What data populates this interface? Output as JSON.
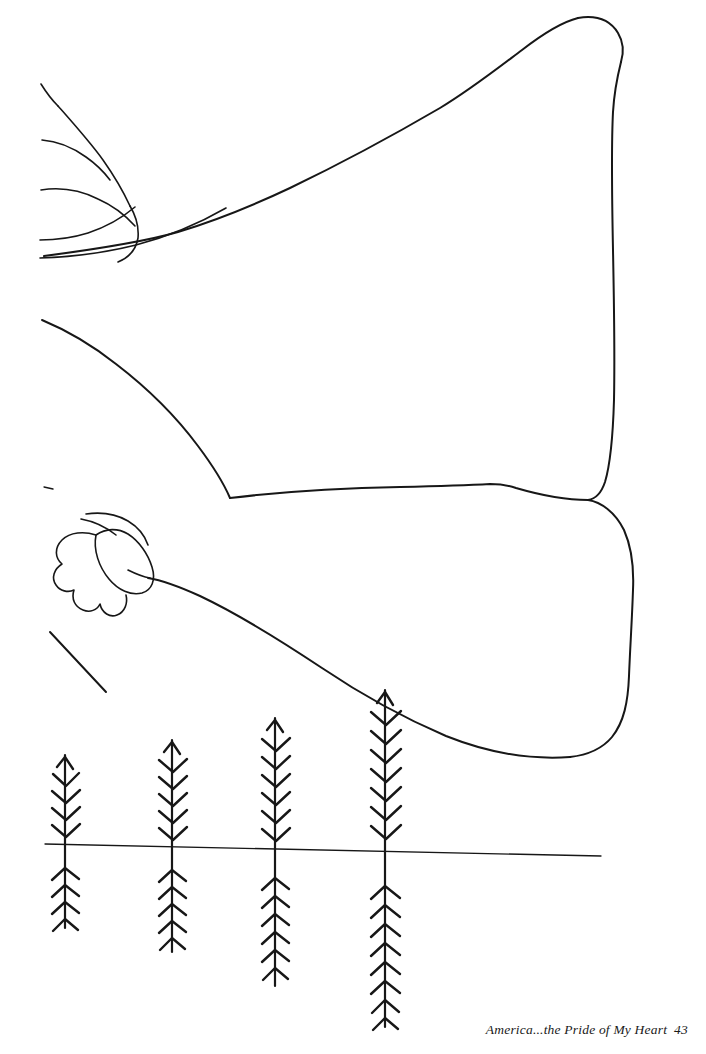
{
  "page": {
    "title": "America...the Pride of My Heart",
    "page_number": "43",
    "background_color": "#ffffff",
    "ink_color": "#171717",
    "width": 706,
    "height": 1054
  },
  "footer": {
    "caption_text": "America...the Pride of My Heart",
    "page_number": "43",
    "full_text": "America...the Pride of My Heart  43"
  },
  "artwork": {
    "kind": "line-art",
    "description": "Outline coloring-book drawing of a waving flag above a row of wheat stalks",
    "elements": [
      {
        "name": "flag-upper-panel",
        "label": "Upper flag panel"
      },
      {
        "name": "flag-lower-panel",
        "label": "Lower flag panel"
      },
      {
        "name": "flag-folds",
        "label": "Fabric folds at hoist"
      },
      {
        "name": "flag-knot",
        "label": "Gathered knot / tassel"
      },
      {
        "name": "pole-stroke",
        "label": "Flag pole stroke"
      },
      {
        "name": "wheat-field",
        "label": "Row of wheat stalks"
      },
      {
        "name": "horizon-line",
        "label": "Horizon line"
      }
    ]
  },
  "wheat": {
    "count": 4,
    "horizon_y": 851,
    "stalks": [
      {
        "id": "stalk-1",
        "x": 65,
        "top": 755,
        "bottom": 928,
        "barbs_above": 5,
        "barbs_below": 5
      },
      {
        "id": "stalk-2",
        "x": 172,
        "top": 740,
        "bottom": 952,
        "barbs_above": 6,
        "barbs_below": 6
      },
      {
        "id": "stalk-3",
        "x": 275,
        "top": 718,
        "bottom": 986,
        "barbs_above": 6,
        "barbs_below": 7
      },
      {
        "id": "stalk-4",
        "x": 385,
        "top": 690,
        "bottom": 1027,
        "barbs_above": 7,
        "barbs_below": 8
      }
    ]
  },
  "horizon": {
    "x_start": 45,
    "x_end": 601,
    "y_start": 844,
    "y_end": 856
  }
}
